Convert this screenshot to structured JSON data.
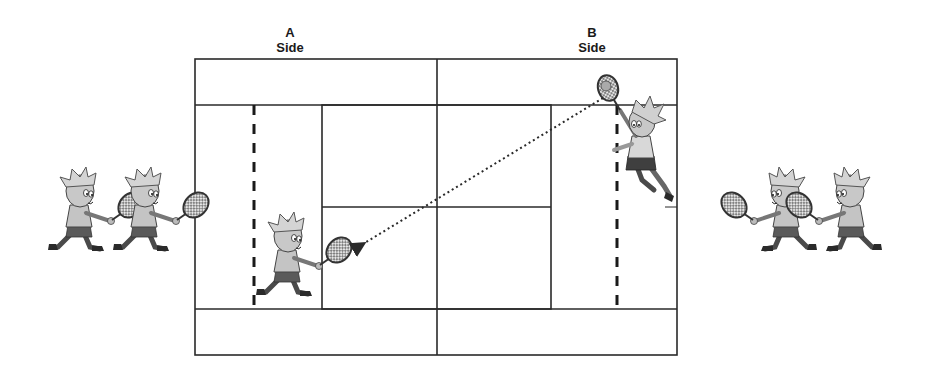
{
  "diagram": {
    "type": "tennis-court-serve-rotation",
    "sides": [
      {
        "id": "A",
        "letter": "A",
        "word": "Side"
      },
      {
        "id": "B",
        "letter": "B",
        "word": "Side"
      }
    ],
    "court": {
      "outer": {
        "x": 195,
        "y": 59,
        "width": 482,
        "height": 296
      },
      "center_line_x": 437,
      "doubles_top_y": 105,
      "doubles_bottom_y": 309,
      "service_box": {
        "x": 322,
        "y": 105,
        "width": 229,
        "height": 204
      },
      "service_center_y": 207,
      "dashed_lines_x": [
        254,
        617
      ],
      "line_color": "#2a2a2a"
    },
    "trajectory": {
      "style": "dotted-arrow",
      "from": {
        "x": 603,
        "y": 98
      },
      "to": {
        "x": 363,
        "y": 244
      },
      "label": ""
    },
    "players": [
      {
        "id": "a-waiting-1",
        "side": "A",
        "role": "waiting",
        "facing": "right",
        "x": 80,
        "y": 213
      },
      {
        "id": "a-waiting-2",
        "side": "A",
        "role": "waiting",
        "facing": "right",
        "x": 145,
        "y": 213
      },
      {
        "id": "a-receiver",
        "side": "A",
        "role": "receiver",
        "facing": "right",
        "x": 288,
        "y": 258
      },
      {
        "id": "b-server",
        "side": "B",
        "role": "server",
        "facing": "left",
        "x": 640,
        "y": 140
      },
      {
        "id": "b-waiting-1",
        "side": "B",
        "role": "waiting",
        "facing": "left",
        "x": 785,
        "y": 213
      },
      {
        "id": "b-waiting-2",
        "side": "B",
        "role": "waiting",
        "facing": "left",
        "x": 850,
        "y": 213
      }
    ],
    "colors": {
      "line": "#2a2a2a",
      "figure_fill": "#b8b8b8",
      "figure_dark": "#4a4a4a",
      "racket_fill": "#d8d8d8"
    }
  }
}
